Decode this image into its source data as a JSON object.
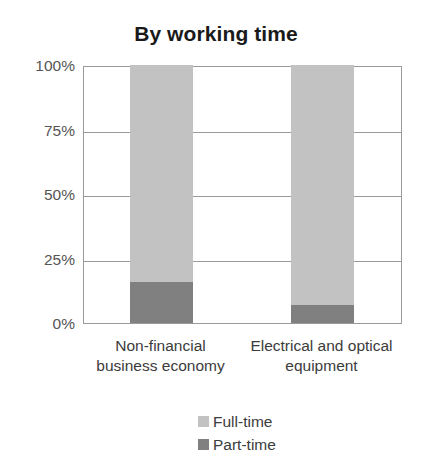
{
  "chart_data": {
    "type": "bar",
    "subtype": "stacked-100-percent",
    "title": "By working time",
    "xlabel": "",
    "ylabel": "",
    "ylim": [
      0,
      100
    ],
    "yticks": [
      "0%",
      "25%",
      "50%",
      "75%",
      "100%"
    ],
    "ytick_values": [
      0,
      25,
      50,
      75,
      100
    ],
    "grid": true,
    "legend_position": "bottom-center",
    "categories": [
      "Non-financial business economy",
      "Electrical and optical equipment"
    ],
    "category_lines": [
      [
        "Non-financial",
        "business economy"
      ],
      [
        "Electrical and optical",
        "equipment"
      ]
    ],
    "series": [
      {
        "name": "Full-time",
        "color": "#c2c2c2",
        "values": [
          84,
          93
        ]
      },
      {
        "name": "Part-time",
        "color": "#808080",
        "values": [
          16,
          7
        ]
      }
    ]
  },
  "legend": {
    "items": [
      {
        "label": "Full-time",
        "color": "#c2c2c2"
      },
      {
        "label": "Part-time",
        "color": "#808080"
      }
    ]
  },
  "colors": {
    "full_time": "#c2c2c2",
    "part_time": "#808080",
    "axis": "#9a9a9a",
    "tick_text": "#555555",
    "label_text": "#3b3b3b",
    "title_text": "#1a1a1a",
    "background": "#ffffff"
  }
}
